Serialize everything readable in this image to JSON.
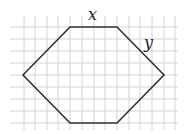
{
  "figure": {
    "type": "hexagon-on-grid",
    "grid": {
      "vertical_lines_x": [
        24,
        35,
        47,
        58,
        70,
        82,
        94,
        105,
        117,
        129,
        140,
        152,
        164,
        175
      ],
      "horizontal_lines_y": [
        27,
        39,
        51,
        63,
        75,
        87,
        99,
        111,
        123
      ],
      "x_start": 10,
      "x_end": 178,
      "y_start": 16,
      "y_end": 130,
      "line_color": "#d4d4d4"
    },
    "hexagon": {
      "points": [
        [
          23,
          75
        ],
        [
          70,
          27
        ],
        [
          117,
          27
        ],
        [
          164,
          75
        ],
        [
          117,
          123
        ],
        [
          70,
          123
        ]
      ],
      "stroke": "#333333"
    },
    "labels": {
      "top_side": "x",
      "slanted_side": "y"
    }
  }
}
